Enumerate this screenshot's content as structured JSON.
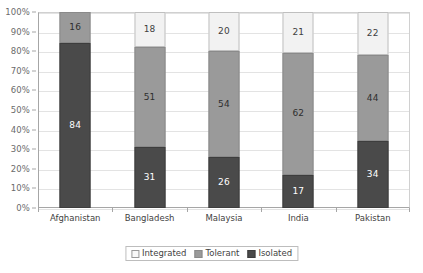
{
  "chart_data": {
    "type": "bar",
    "subtype": "100% stacked column",
    "title": "",
    "xlabel": "",
    "ylabel": "",
    "ylim": [
      0,
      100
    ],
    "ytick_labels": [
      "0%",
      "10%",
      "20%",
      "30%",
      "40%",
      "50%",
      "60%",
      "70%",
      "80%",
      "90%",
      "100%"
    ],
    "ytick_values": [
      0,
      10,
      20,
      30,
      40,
      50,
      60,
      70,
      80,
      90,
      100
    ],
    "grid": true,
    "legend_position": "bottom",
    "categories": [
      "Afghanistan",
      "Bangladesh",
      "Malaysia",
      "India",
      "Pakistan"
    ],
    "stack_order_bottom_to_top": [
      "Isolated",
      "Tolerant",
      "Integrated"
    ],
    "series": [
      {
        "name": "Integrated",
        "color": "#f2f2f2",
        "label_color": "#3f3f3f",
        "values": [
          0,
          18,
          20,
          21,
          22
        ],
        "labels": [
          "",
          "18",
          "20",
          "21",
          "22"
        ]
      },
      {
        "name": "Tolerant",
        "color": "#9a9a9a",
        "label_color": "#2e2e2e",
        "values": [
          16,
          51,
          54,
          62,
          44
        ],
        "labels": [
          "16",
          "51",
          "54",
          "62",
          "44"
        ]
      },
      {
        "name": "Isolated",
        "color": "#4a4a4a",
        "label_color": "#ffffff",
        "values": [
          84,
          31,
          26,
          17,
          34
        ],
        "labels": [
          "84",
          "31",
          "26",
          "17",
          "34"
        ]
      }
    ]
  },
  "legend": {
    "items": [
      {
        "label": "Integrated",
        "swatch": "sw-integrated"
      },
      {
        "label": "Tolerant",
        "swatch": "sw-tolerant"
      },
      {
        "label": "Isolated",
        "swatch": "sw-isolated"
      }
    ]
  },
  "colors": {
    "integrated": "#f2f2f2",
    "tolerant": "#9a9a9a",
    "isolated": "#4a4a4a",
    "gridline": "#e3e3e3",
    "axis": "#a6a6a6",
    "tick_text": "#6b6b6b",
    "category_text": "#3f3f3f"
  }
}
